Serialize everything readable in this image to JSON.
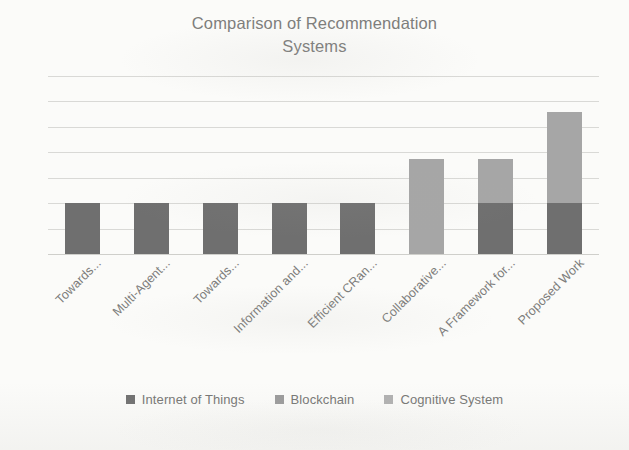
{
  "chart_data": {
    "type": "bar",
    "subtype": "stacked-column",
    "title": "Comparison of Recommendation Systems",
    "title_lines": [
      "Comparison of Recommendation",
      "Systems"
    ],
    "xlabel": "",
    "ylabel": "",
    "grid": true,
    "gridlines": 7,
    "axis_values_visible": false,
    "ylim": [
      0,
      7
    ],
    "legend_position": "bottom",
    "categories": [
      "Towards...",
      "Multi-Agent...",
      "Towards...",
      "Information and...",
      "Efficient CRan...",
      "Collaborative...",
      "A Framework for...",
      "Proposed Work"
    ],
    "series": [
      {
        "name": "Internet of Things",
        "color": "#6f6f6f",
        "values": [
          2,
          2,
          2,
          2,
          2,
          0,
          2,
          2
        ]
      },
      {
        "name": "Blockchain",
        "color": "#9a9a9a",
        "values": [
          0,
          0,
          0,
          0,
          0,
          0,
          0,
          0
        ]
      },
      {
        "name": "Cognitive System",
        "color": "#a6a6a6",
        "values": [
          0,
          0,
          0,
          0,
          0,
          3.75,
          1.75,
          3.6
        ]
      }
    ],
    "totals": [
      2,
      2,
      2,
      2,
      2,
      3.75,
      3.75,
      5.6
    ]
  },
  "legend": {
    "items": [
      {
        "label": "Internet of Things",
        "color": "#6f6f6f"
      },
      {
        "label": "Blockchain",
        "color": "#9a9a9a"
      },
      {
        "label": "Cognitive System",
        "color": "#b0b0b0"
      }
    ]
  },
  "colors": {
    "background": "#fbfbf9",
    "gridline": "#d9d9d6",
    "text": "#7d7d7b",
    "title": "#7e7e7c"
  }
}
